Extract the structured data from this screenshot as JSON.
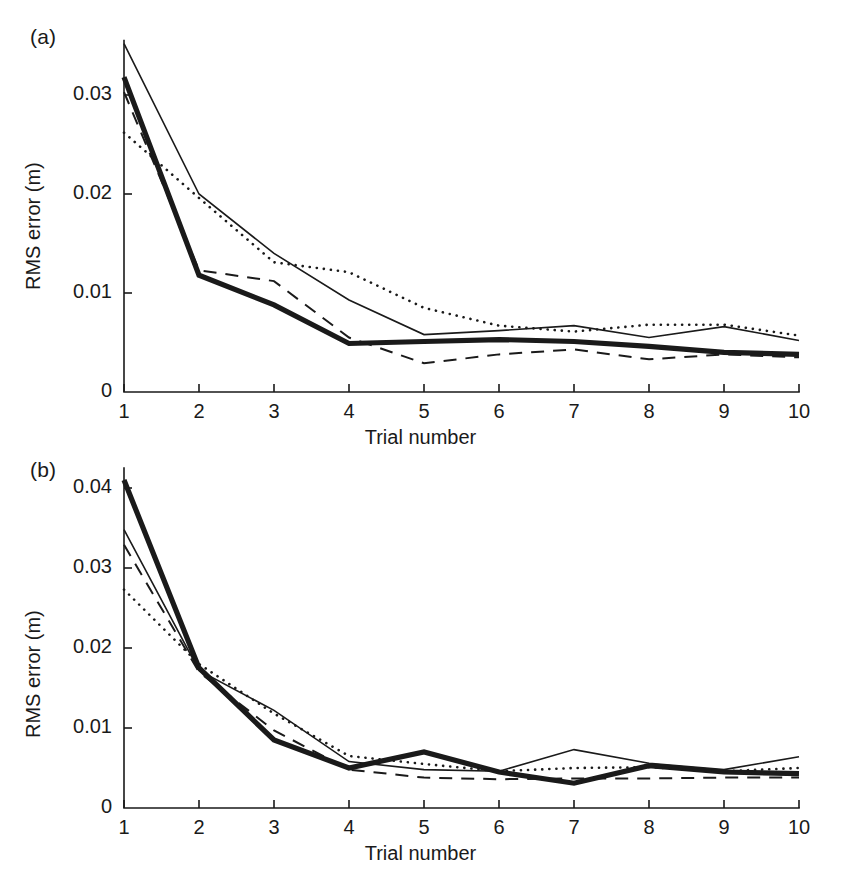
{
  "figure": {
    "background": "#ffffff",
    "ink_color": "#1a1a1a"
  },
  "panels": [
    {
      "id": "a",
      "label": "(a)",
      "xlabel": "Trial number",
      "ylabel": "RMS error (m)",
      "ytick_labels": [
        "0.03",
        "0.02",
        "0.01",
        "0"
      ],
      "xtick_labels": [
        "1",
        "2",
        "3",
        "4",
        "5",
        "6",
        "7",
        "8",
        "9",
        "10"
      ]
    },
    {
      "id": "b",
      "label": "(b)",
      "xlabel": "Trial number",
      "ylabel": "RMS error (m)",
      "ytick_labels": [
        "0.04",
        "0.03",
        "0.02",
        "0.01",
        "0"
      ],
      "xtick_labels": [
        "1",
        "2",
        "3",
        "4",
        "5",
        "6",
        "7",
        "8",
        "9",
        "10"
      ]
    }
  ],
  "chart_data": [
    {
      "type": "line",
      "panel": "a",
      "title": "(a)",
      "xlabel": "Trial number",
      "ylabel": "RMS error (m)",
      "x": [
        1,
        2,
        3,
        4,
        5,
        6,
        7,
        8,
        9,
        10
      ],
      "xlim": [
        1,
        10
      ],
      "ylim": [
        0,
        0.0355
      ],
      "yticks": [
        0,
        0.01,
        0.02,
        0.03
      ],
      "xticks": [
        1,
        2,
        3,
        4,
        5,
        6,
        7,
        8,
        9,
        10
      ],
      "grid": false,
      "legend": "none",
      "series": [
        {
          "name": "thin-solid",
          "style": "solid-thin",
          "values": [
            0.0352,
            0.02,
            0.014,
            0.0093,
            0.0058,
            0.0062,
            0.0067,
            0.0055,
            0.0066,
            0.0052
          ]
        },
        {
          "name": "dotted",
          "style": "dotted",
          "values": [
            0.0262,
            0.0196,
            0.0131,
            0.0121,
            0.0085,
            0.0067,
            0.0061,
            0.0068,
            0.0068,
            0.0057
          ]
        },
        {
          "name": "thick-solid",
          "style": "solid-thick",
          "values": [
            0.0318,
            0.0118,
            0.0088,
            0.0049,
            0.0051,
            0.0053,
            0.0051,
            0.0046,
            0.004,
            0.0038
          ]
        },
        {
          "name": "dashed",
          "style": "dashed",
          "values": [
            0.0303,
            0.0123,
            0.0112,
            0.0055,
            0.0029,
            0.0038,
            0.0043,
            0.0033,
            0.0038,
            0.0035
          ]
        }
      ]
    },
    {
      "type": "line",
      "panel": "b",
      "title": "(b)",
      "xlabel": "Trial number",
      "ylabel": "RMS error (m)",
      "x": [
        1,
        2,
        3,
        4,
        5,
        6,
        7,
        8,
        9,
        10
      ],
      "xlim": [
        1,
        10
      ],
      "ylim": [
        0,
        0.0425
      ],
      "yticks": [
        0,
        0.01,
        0.02,
        0.03,
        0.04
      ],
      "xticks": [
        1,
        2,
        3,
        4,
        5,
        6,
        7,
        8,
        9,
        10
      ],
      "grid": false,
      "legend": "none",
      "series": [
        {
          "name": "thick-solid",
          "style": "solid-thick",
          "values": [
            0.041,
            0.0175,
            0.0085,
            0.005,
            0.007,
            0.0045,
            0.0031,
            0.0053,
            0.0045,
            0.0043
          ]
        },
        {
          "name": "thin-solid",
          "style": "solid-thin",
          "values": [
            0.0348,
            0.0172,
            0.0122,
            0.0058,
            0.0048,
            0.0046,
            0.0073,
            0.0056,
            0.0048,
            0.0064
          ]
        },
        {
          "name": "dashed",
          "style": "dashed",
          "values": [
            0.0329,
            0.017,
            0.0097,
            0.0048,
            0.0038,
            0.0036,
            0.0037,
            0.0037,
            0.0038,
            0.0038
          ]
        },
        {
          "name": "dotted",
          "style": "dotted",
          "values": [
            0.0273,
            0.018,
            0.0118,
            0.0065,
            0.0055,
            0.0046,
            0.005,
            0.0051,
            0.0046,
            0.005
          ]
        }
      ]
    }
  ]
}
